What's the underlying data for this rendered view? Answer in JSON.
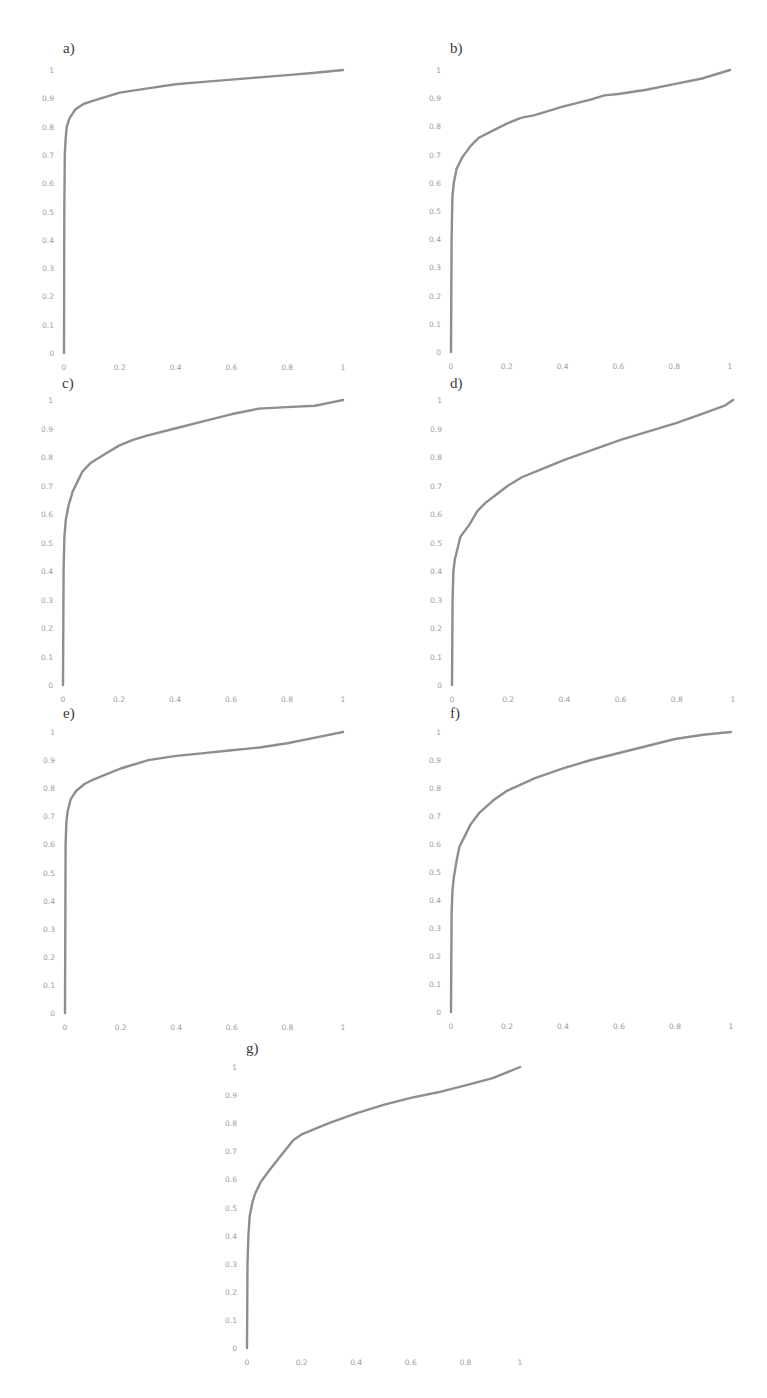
{
  "figure": {
    "panels": [
      {
        "id": "a",
        "label": "a)"
      },
      {
        "id": "b",
        "label": "b)"
      },
      {
        "id": "c",
        "label": "c)"
      },
      {
        "id": "d",
        "label": "d)"
      },
      {
        "id": "e",
        "label": "e)"
      },
      {
        "id": "f",
        "label": "f)"
      },
      {
        "id": "g",
        "label": "g)"
      }
    ]
  },
  "chart_data": [
    {
      "panel": "a)",
      "type": "line",
      "title": "a)",
      "xlabel": "",
      "ylabel": "",
      "xlim": [
        0,
        1
      ],
      "ylim": [
        0,
        1
      ],
      "xticks": [
        "0",
        "0.2",
        "0.4",
        "0.6",
        "0.8",
        "1"
      ],
      "yticks": [
        "0",
        "0.1",
        "0.2",
        "0.3",
        "0.4",
        "0.5",
        "0.6",
        "0.7",
        "0.8",
        "0.9",
        "1"
      ],
      "grid": false,
      "legend": null,
      "series": [
        {
          "name": "curve",
          "color": "#8e8e8e",
          "x": [
            0,
            0.001,
            0.003,
            0.006,
            0.01,
            0.02,
            0.04,
            0.07,
            0.1,
            0.15,
            0.2,
            0.3,
            0.4,
            0.5,
            0.6,
            0.7,
            0.8,
            0.9,
            1.0
          ],
          "y": [
            0,
            0.5,
            0.7,
            0.76,
            0.8,
            0.83,
            0.86,
            0.88,
            0.89,
            0.905,
            0.92,
            0.935,
            0.95,
            0.958,
            0.966,
            0.974,
            0.982,
            0.99,
            1.0
          ]
        }
      ]
    },
    {
      "panel": "b)",
      "type": "line",
      "title": "b)",
      "xlabel": "",
      "ylabel": "",
      "xlim": [
        0,
        1
      ],
      "ylim": [
        0,
        1
      ],
      "xticks": [
        "0",
        "0.2",
        "0.4",
        "0.6",
        "0.8",
        "1"
      ],
      "yticks": [
        "0",
        "0.1",
        "0.2",
        "0.3",
        "0.4",
        "0.5",
        "0.6",
        "0.7",
        "0.8",
        "0.9",
        "1"
      ],
      "grid": false,
      "legend": null,
      "series": [
        {
          "name": "curve",
          "color": "#8e8e8e",
          "x": [
            0,
            0.002,
            0.005,
            0.01,
            0.02,
            0.04,
            0.07,
            0.1,
            0.15,
            0.2,
            0.25,
            0.3,
            0.4,
            0.5,
            0.55,
            0.6,
            0.7,
            0.8,
            0.9,
            1.0
          ],
          "y": [
            0,
            0.4,
            0.55,
            0.6,
            0.65,
            0.69,
            0.73,
            0.76,
            0.785,
            0.81,
            0.83,
            0.84,
            0.87,
            0.895,
            0.91,
            0.915,
            0.93,
            0.95,
            0.97,
            1.0
          ]
        }
      ]
    },
    {
      "panel": "c)",
      "type": "line",
      "title": "c)",
      "xlabel": "",
      "ylabel": "",
      "xlim": [
        0,
        1
      ],
      "ylim": [
        0,
        1
      ],
      "xticks": [
        "0",
        "0.2",
        "0.4",
        "0.6",
        "0.8",
        "1"
      ],
      "yticks": [
        "0",
        "0.1",
        "0.2",
        "0.3",
        "0.4",
        "0.5",
        "0.6",
        "0.7",
        "0.8",
        "0.9",
        "1"
      ],
      "grid": false,
      "legend": null,
      "series": [
        {
          "name": "curve",
          "color": "#8e8e8e",
          "x": [
            0,
            0.002,
            0.005,
            0.01,
            0.02,
            0.035,
            0.05,
            0.07,
            0.1,
            0.15,
            0.2,
            0.25,
            0.3,
            0.4,
            0.5,
            0.6,
            0.7,
            0.8,
            0.9,
            0.95,
            1.0
          ],
          "y": [
            0,
            0.4,
            0.52,
            0.58,
            0.63,
            0.68,
            0.71,
            0.75,
            0.78,
            0.81,
            0.84,
            0.86,
            0.875,
            0.9,
            0.925,
            0.95,
            0.97,
            0.975,
            0.98,
            0.99,
            1.0
          ]
        }
      ]
    },
    {
      "panel": "d)",
      "type": "line",
      "title": "d)",
      "xlabel": "",
      "ylabel": "",
      "xlim": [
        0,
        1
      ],
      "ylim": [
        0,
        1
      ],
      "xticks": [
        "0",
        "0.2",
        "0.4",
        "0.6",
        "0.8",
        "1"
      ],
      "yticks": [
        "0",
        "0.1",
        "0.2",
        "0.3",
        "0.4",
        "0.5",
        "0.6",
        "0.7",
        "0.8",
        "0.9",
        "1"
      ],
      "grid": false,
      "legend": null,
      "series": [
        {
          "name": "curve",
          "color": "#8e8e8e",
          "x": [
            0,
            0.002,
            0.005,
            0.01,
            0.02,
            0.03,
            0.06,
            0.09,
            0.12,
            0.16,
            0.2,
            0.25,
            0.3,
            0.4,
            0.5,
            0.6,
            0.7,
            0.8,
            0.9,
            0.97,
            1.0
          ],
          "y": [
            0,
            0.3,
            0.4,
            0.44,
            0.48,
            0.52,
            0.56,
            0.61,
            0.64,
            0.67,
            0.7,
            0.73,
            0.75,
            0.79,
            0.825,
            0.86,
            0.89,
            0.92,
            0.955,
            0.98,
            1.0
          ]
        }
      ]
    },
    {
      "panel": "e)",
      "type": "line",
      "title": "e)",
      "xlabel": "",
      "ylabel": "",
      "xlim": [
        0,
        1
      ],
      "ylim": [
        0,
        1
      ],
      "xticks": [
        "0",
        "0.2",
        "0.4",
        "0.6",
        "0.8",
        "1"
      ],
      "yticks": [
        "0",
        "0.1",
        "0.2",
        "0.3",
        "0.4",
        "0.5",
        "0.6",
        "0.7",
        "0.8",
        "0.9",
        "1"
      ],
      "grid": false,
      "legend": null,
      "series": [
        {
          "name": "curve",
          "color": "#8e8e8e",
          "x": [
            0,
            0.002,
            0.005,
            0.01,
            0.02,
            0.04,
            0.07,
            0.1,
            0.15,
            0.2,
            0.3,
            0.4,
            0.5,
            0.6,
            0.7,
            0.8,
            0.9,
            1.0
          ],
          "y": [
            0,
            0.6,
            0.68,
            0.72,
            0.76,
            0.79,
            0.815,
            0.83,
            0.85,
            0.87,
            0.9,
            0.915,
            0.925,
            0.935,
            0.945,
            0.96,
            0.98,
            1.0
          ]
        }
      ]
    },
    {
      "panel": "f)",
      "type": "line",
      "title": "f)",
      "xlabel": "",
      "ylabel": "",
      "xlim": [
        0,
        1
      ],
      "ylim": [
        0,
        1
      ],
      "xticks": [
        "0",
        "0.2",
        "0.4",
        "0.6",
        "0.8",
        "1"
      ],
      "yticks": [
        "0",
        "0.1",
        "0.2",
        "0.3",
        "0.4",
        "0.5",
        "0.6",
        "0.7",
        "0.8",
        "0.9",
        "1"
      ],
      "grid": false,
      "legend": null,
      "series": [
        {
          "name": "curve",
          "color": "#8e8e8e",
          "x": [
            0,
            0.002,
            0.005,
            0.01,
            0.02,
            0.03,
            0.05,
            0.07,
            0.1,
            0.15,
            0.2,
            0.3,
            0.4,
            0.5,
            0.6,
            0.7,
            0.8,
            0.9,
            1.0
          ],
          "y": [
            0,
            0.35,
            0.43,
            0.48,
            0.54,
            0.59,
            0.63,
            0.67,
            0.71,
            0.755,
            0.79,
            0.835,
            0.87,
            0.9,
            0.925,
            0.95,
            0.975,
            0.99,
            1.0
          ]
        }
      ]
    },
    {
      "panel": "g)",
      "type": "line",
      "title": "g)",
      "xlabel": "",
      "ylabel": "",
      "xlim": [
        0,
        1
      ],
      "ylim": [
        0,
        1
      ],
      "xticks": [
        "0",
        "0.2",
        "0.4",
        "0.6",
        "0.8",
        "1"
      ],
      "yticks": [
        "0",
        "0.1",
        "0.2",
        "0.3",
        "0.4",
        "0.5",
        "0.6",
        "0.7",
        "0.8",
        "0.9",
        "1"
      ],
      "grid": false,
      "legend": null,
      "series": [
        {
          "name": "curve",
          "color": "#8e8e8e",
          "x": [
            0,
            0.002,
            0.005,
            0.01,
            0.02,
            0.03,
            0.05,
            0.08,
            0.12,
            0.17,
            0.2,
            0.3,
            0.4,
            0.5,
            0.6,
            0.7,
            0.8,
            0.9,
            1.0
          ],
          "y": [
            0,
            0.3,
            0.4,
            0.47,
            0.52,
            0.55,
            0.59,
            0.63,
            0.68,
            0.74,
            0.76,
            0.8,
            0.835,
            0.865,
            0.89,
            0.91,
            0.935,
            0.96,
            1.0
          ]
        }
      ]
    }
  ]
}
